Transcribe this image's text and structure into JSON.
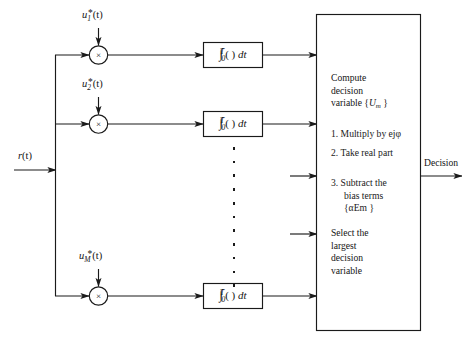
{
  "diagram": {
    "background_color": "#ffffff",
    "line_color": "#1a1a1a",
    "input": {
      "label_main": "r",
      "label_paren": "(t)"
    },
    "output": {
      "label": "Decision"
    },
    "branches": [
      {
        "id": "branch-1",
        "signal_base": "u",
        "signal_sub": "1",
        "signal_star": "*",
        "signal_paren": "(t)",
        "multiplier_glyph": "×",
        "integrator_int": "∫",
        "integrator_upper": "T",
        "integrator_lower": "0",
        "integrator_arg": "(  )",
        "integrator_diff": "dt"
      },
      {
        "id": "branch-2",
        "signal_base": "u",
        "signal_sub": "2",
        "signal_star": "*",
        "signal_paren": "(t)",
        "multiplier_glyph": "×",
        "integrator_int": "∫",
        "integrator_upper": "T",
        "integrator_lower": "0",
        "integrator_arg": "(  )",
        "integrator_diff": "dt"
      },
      {
        "id": "branch-M",
        "signal_base": "u",
        "signal_sub": "M",
        "signal_star": "*",
        "signal_paren": "(t)",
        "multiplier_glyph": "×",
        "integrator_int": "∫",
        "integrator_upper": "T",
        "integrator_lower": "0",
        "integrator_arg": "(  )",
        "integrator_diff": "dt"
      }
    ],
    "processor": {
      "heading_line1": "Compute",
      "heading_line2": "decision",
      "heading_line3_pre": "variable {",
      "heading_line3_var": "U",
      "heading_line3_sub": "m",
      "heading_line3_post": " }",
      "steps": [
        {
          "number": "1.",
          "text_pre": "Multiply by ",
          "math_base": "e",
          "math_sup": "jφ",
          "text_post": ""
        },
        {
          "number": "2.",
          "text_pre": "Take real part",
          "math_base": "",
          "math_sup": "",
          "text_post": ""
        },
        {
          "number": "3.",
          "text_pre": "Subtract the",
          "line2": "bias terms",
          "line3_pre": "{",
          "line3_alpha": "α",
          "line3_var": "E",
          "line3_sub": "m",
          "line3_post": " }"
        }
      ],
      "select_line1": "Select the",
      "select_line2": "largest",
      "select_line3": "decision",
      "select_line4": "variable"
    },
    "ellipsis_dot_count": 11
  }
}
